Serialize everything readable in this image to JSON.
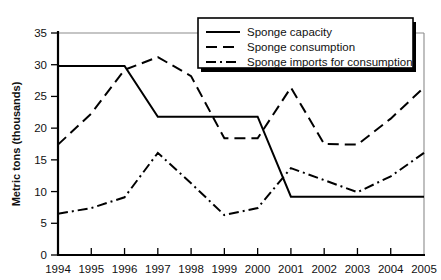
{
  "chart_data": {
    "type": "line",
    "title": "",
    "xlabel": "",
    "ylabel": "Metric tons (thousands)",
    "x": [
      1994,
      1995,
      1996,
      1997,
      1998,
      1999,
      2000,
      2001,
      2002,
      2003,
      2004,
      2005
    ],
    "xtick_labels": [
      "1994",
      "1995",
      "1996",
      "1997",
      "1998",
      "1999",
      "2000",
      "2001",
      "2002",
      "2003",
      "2004",
      "2005"
    ],
    "ytick_labels": [
      "0",
      "5",
      "10",
      "15",
      "20",
      "25",
      "30",
      "35"
    ],
    "ytick_values": [
      0,
      5,
      10,
      15,
      20,
      25,
      30,
      35
    ],
    "ylim": [
      0,
      35
    ],
    "xlim": [
      1994,
      2005
    ],
    "grid": false,
    "legend_position": "top-right",
    "series": [
      {
        "name": "Sponge capacity",
        "style": "solid",
        "values": [
          29.8,
          29.8,
          29.8,
          21.8,
          21.8,
          21.8,
          21.8,
          9.2,
          9.2,
          9.2,
          9.2,
          9.2
        ]
      },
      {
        "name": "Sponge consumption",
        "style": "dashed",
        "values": [
          17.4,
          22.3,
          29.2,
          31.2,
          28.2,
          18.4,
          18.4,
          26.4,
          17.5,
          17.4,
          21.5,
          26.4
        ]
      },
      {
        "name": "Sponge imports for consumption",
        "style": "dash-dot",
        "values": [
          6.5,
          7.4,
          9.1,
          16.1,
          11.3,
          6.3,
          7.4,
          13.7,
          11.8,
          9.9,
          12.4,
          16.1
        ]
      }
    ]
  },
  "legend": {
    "items": [
      {
        "label": "Sponge capacity",
        "style": "solid"
      },
      {
        "label": "Sponge consumption",
        "style": "dashed"
      },
      {
        "label": "Sponge imports for consumption",
        "style": "dash-dot"
      }
    ]
  },
  "axes": {
    "y_axis_title": "Metric tons (thousands)"
  }
}
